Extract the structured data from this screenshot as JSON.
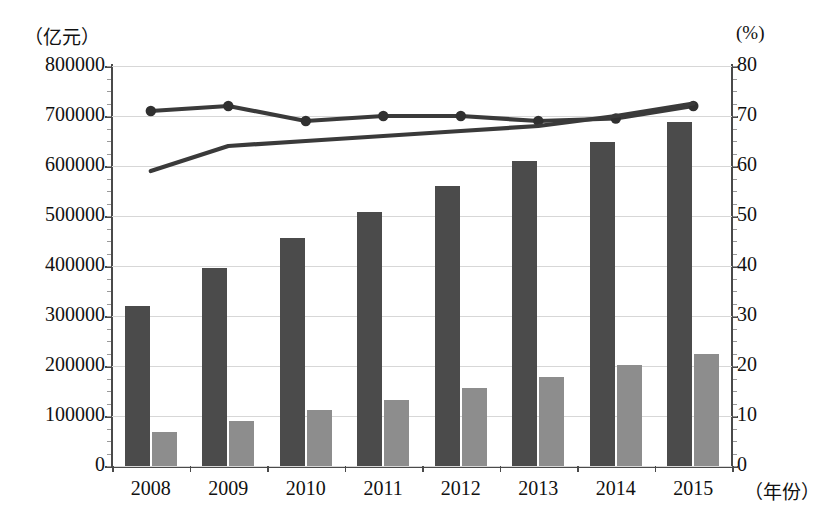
{
  "chart_data": {
    "type": "bar",
    "title": "",
    "subtitle": "",
    "xlabel": "（年份）",
    "ylabel": "（亿元）",
    "y2label": "(%)",
    "categories": [
      "2008",
      "2009",
      "2010",
      "2011",
      "2012",
      "2013",
      "2014",
      "2015"
    ],
    "ylim": [
      0,
      800000
    ],
    "y2lim": [
      0,
      80
    ],
    "yticks": [
      "0",
      "100000",
      "200000",
      "300000",
      "400000",
      "500000",
      "600000",
      "700000",
      "800000"
    ],
    "ytick_values": [
      0,
      100000,
      200000,
      300000,
      400000,
      500000,
      600000,
      700000,
      800000
    ],
    "y2ticks": [
      "0",
      "10",
      "20",
      "30",
      "40",
      "50",
      "60",
      "70",
      "80"
    ],
    "y2tick_values": [
      0,
      10,
      20,
      30,
      40,
      50,
      60,
      70,
      80
    ],
    "grid": true,
    "legend": "none",
    "series": [
      {
        "name": "bar-series-dark",
        "type": "bar",
        "axis": "left",
        "color": "#4b4b4b",
        "values": [
          320000,
          396000,
          456000,
          508000,
          560000,
          610000,
          648000,
          688000
        ]
      },
      {
        "name": "bar-series-light",
        "type": "bar",
        "axis": "left",
        "color": "#8d8d8d",
        "values": [
          68000,
          90000,
          112000,
          132000,
          156000,
          178000,
          202000,
          224000
        ]
      },
      {
        "name": "line-series-marked",
        "type": "line",
        "axis": "right",
        "color": "#303030",
        "markers": true,
        "values": [
          71.0,
          72.0,
          69.0,
          70.0,
          70.0,
          69.0,
          69.5,
          72.0
        ]
      },
      {
        "name": "line-series-plain",
        "type": "line",
        "axis": "right",
        "color": "#3a3a3a",
        "markers": false,
        "values": [
          59.0,
          64.0,
          65.0,
          66.0,
          67.0,
          68.0,
          70.0,
          72.5
        ]
      }
    ]
  },
  "colors": {
    "bar_dark": "#4b4b4b",
    "bar_light": "#8d8d8d",
    "line": "#303030",
    "grid": "#d7d7d7",
    "axis": "#4a4a4a",
    "background": "#ffffff"
  }
}
